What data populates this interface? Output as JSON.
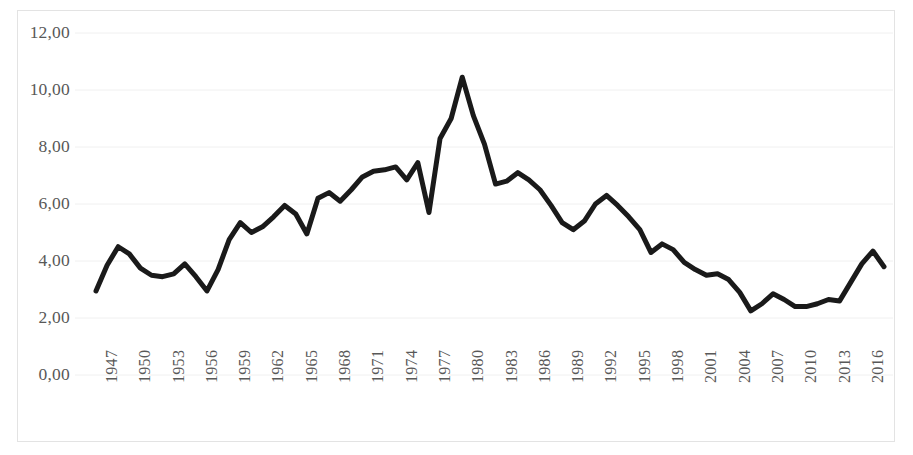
{
  "chart_data": {
    "type": "line",
    "title": "",
    "subtitle": "",
    "xlabel": "",
    "ylabel": "",
    "grid": true,
    "legend": null,
    "legend_position": "none",
    "line_color": "#1a1a1a",
    "line_width": 5,
    "axis_text_color": "#585858",
    "gridline_color": "#f0f0f0",
    "border_color": "#e3e3e3",
    "background_color": "#ffffff",
    "ylim": [
      0,
      12
    ],
    "ytick_step": 2,
    "ytick_labels": [
      "0,00",
      "2,00",
      "4,00",
      "6,00",
      "8,00",
      "10,00",
      "12,00"
    ],
    "ytick_values": [
      0,
      2,
      4,
      6,
      8,
      10,
      12
    ],
    "xtick_labels": [
      "1947",
      "1950",
      "1953",
      "1956",
      "1959",
      "1962",
      "1965",
      "1968",
      "1971",
      "1974",
      "1977",
      "1980",
      "1983",
      "1986",
      "1989",
      "1992",
      "1995",
      "1998",
      "2001",
      "2004",
      "2007",
      "2010",
      "2013",
      "2016"
    ],
    "xtick_interval": 3,
    "xlim": [
      1947,
      2018
    ],
    "x": [
      1947,
      1948,
      1949,
      1950,
      1951,
      1952,
      1953,
      1954,
      1955,
      1956,
      1957,
      1958,
      1959,
      1960,
      1961,
      1962,
      1963,
      1964,
      1965,
      1966,
      1967,
      1968,
      1969,
      1970,
      1971,
      1972,
      1973,
      1974,
      1975,
      1976,
      1977,
      1978,
      1979,
      1980,
      1981,
      1982,
      1983,
      1984,
      1985,
      1986,
      1987,
      1988,
      1989,
      1990,
      1991,
      1992,
      1993,
      1994,
      1995,
      1996,
      1997,
      1998,
      1999,
      2000,
      2001,
      2002,
      2003,
      2004,
      2005,
      2006,
      2007,
      2008,
      2009,
      2010,
      2011,
      2012,
      2013,
      2014,
      2015,
      2016,
      2017,
      2018
    ],
    "values": [
      2.95,
      3.85,
      4.5,
      4.25,
      3.75,
      3.5,
      3.45,
      3.55,
      3.9,
      3.45,
      2.95,
      3.7,
      4.75,
      5.35,
      5.0,
      5.2,
      5.55,
      5.95,
      5.65,
      4.95,
      6.2,
      6.4,
      6.1,
      6.5,
      6.95,
      7.15,
      7.2,
      7.3,
      6.85,
      7.45,
      5.7,
      8.3,
      9.0,
      10.45,
      9.1,
      8.1,
      6.7,
      6.8,
      7.1,
      6.85,
      6.5,
      5.95,
      5.35,
      5.1,
      5.4,
      6.0,
      6.3,
      5.95,
      5.55,
      5.1,
      4.3,
      4.6,
      4.4,
      3.95,
      3.7,
      3.5,
      3.55,
      3.35,
      2.9,
      2.25,
      2.5,
      2.85,
      2.65,
      2.4,
      2.4,
      2.5,
      2.65,
      2.6,
      3.25,
      3.9,
      4.35,
      3.8
    ]
  }
}
